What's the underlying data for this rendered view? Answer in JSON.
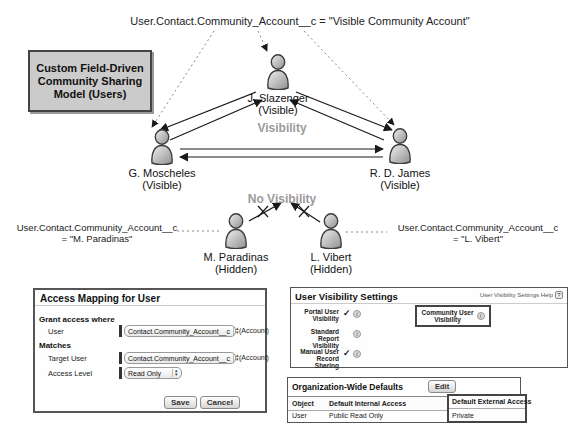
{
  "colors": {
    "muted_label": "#9b9b9b",
    "title_box_bg": "#cbcbcb",
    "panel_border": "#555555",
    "required_bar": "#333333",
    "arrow_line": "#1a1a1a",
    "dotted_line": "#888888"
  },
  "diagram": {
    "title_box": "Custom Field-Driven Community Sharing Model (Users)",
    "top_annotation": "User.Contact.Community_Account__c = \"Visible Community Account\"",
    "visibility_label": "Visibility",
    "no_visibility_label": "No Visibility",
    "left_annotation": {
      "line1": "User.Contact.Community_Account__c",
      "line2": "= \"M. Paradinas\""
    },
    "right_annotation": {
      "line1": "User.Contact.Community_Account__c",
      "line2": "= \"L. Vibert\""
    },
    "users": {
      "slazenger": {
        "name": "J. Slazenger",
        "status": "(Visible)"
      },
      "moscheles": {
        "name": "G. Moscheles",
        "status": "(Visible)"
      },
      "james": {
        "name": "R. D. James",
        "status": "(Visible)"
      },
      "paradinas": {
        "name": "M. Paradinas",
        "status": "(Hidden)"
      },
      "vibert": {
        "name": "L. Vibert",
        "status": "(Hidden)"
      }
    }
  },
  "access_mapping": {
    "title": "Access Mapping for User",
    "grant_section": "Grant access where",
    "user_label": "User",
    "user_value": "Contact.Community_Account__c",
    "user_suffix": "(Account)",
    "matches_section": "Matches",
    "target_label": "Target User",
    "target_value": "Contact.Community_Account__c",
    "target_suffix": "(Account)",
    "access_label": "Access Level",
    "access_value": "Read Only",
    "save_label": "Save",
    "cancel_label": "Cancel"
  },
  "visibility_settings": {
    "title": "User Visibility Settings",
    "help_label": "User Visibility Settings Help",
    "rows": [
      {
        "label": "Portal User Visibility",
        "check": "✓"
      },
      {
        "label": "Standard Report Visibility",
        "check": ""
      },
      {
        "label": "Manual User Record Sharing",
        "check": "✓"
      }
    ],
    "highlight_label": "Community User Visibility"
  },
  "org_wide_defaults": {
    "title": "Organization-Wide Defaults",
    "edit_label": "Edit",
    "columns": [
      "Object",
      "Default Internal Access",
      "Default External Access"
    ],
    "row": {
      "object": "User",
      "internal": "Public Read Only",
      "external": "Private"
    }
  },
  "icons": {
    "stepper_up": "▴",
    "stepper_down": "▾",
    "info": "i",
    "help": "?"
  }
}
